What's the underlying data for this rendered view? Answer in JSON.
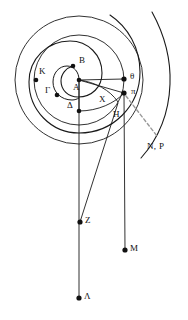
{
  "figure": {
    "background_color": "#ffffff",
    "stroke_color": "#1a1a1a",
    "dash_color": "#9a9a9a",
    "point_color": "#111111"
  },
  "labels": {
    "A": "A",
    "B": "B",
    "K": "K",
    "Gamma": "Γ",
    "Delta": "Δ",
    "theta": "θ",
    "pi": "π",
    "X": "X",
    "H": "H",
    "NP": "N, P",
    "Z": "Z",
    "M": "M",
    "Lambda": "Λ"
  },
  "points": [
    {
      "id": "A",
      "label": "A",
      "x": 79,
      "y": 80,
      "label_x": 73,
      "label_y": 83,
      "dot": true
    },
    {
      "id": "B",
      "label": "B",
      "x": 73,
      "y": 66,
      "label_x": 79,
      "label_y": 58,
      "dot": true
    },
    {
      "id": "K",
      "label": "K",
      "x": 36,
      "y": 80,
      "label_x": 39,
      "label_y": 69,
      "dot": true
    },
    {
      "id": "Gamma",
      "label": "Γ",
      "x": 57,
      "y": 95,
      "label_x": 46,
      "label_y": 88,
      "dot": true
    },
    {
      "id": "Delta",
      "label": "Δ",
      "x": 79,
      "y": 111,
      "label_x": 68,
      "label_y": 103,
      "dot": true
    },
    {
      "id": "theta",
      "label": "θ",
      "x": 124,
      "y": 79,
      "label_x": 130,
      "label_y": 73,
      "dot": true
    },
    {
      "id": "pi",
      "label": "π",
      "x": 124,
      "y": 93,
      "label_x": 131,
      "label_y": 88,
      "dot": true
    },
    {
      "id": "X",
      "label": "X",
      "x": 104,
      "y": 99,
      "label_x": 100,
      "label_y": 97,
      "dot": false
    },
    {
      "id": "H",
      "label": "H",
      "x": 118,
      "y": 114,
      "label_x": 114,
      "label_y": 112,
      "dot": false
    },
    {
      "id": "NP",
      "label": "N, P",
      "x": 152,
      "y": 148,
      "label_x": 148,
      "label_y": 143,
      "dot": false
    },
    {
      "id": "Z",
      "label": "Z",
      "x": 80,
      "y": 222,
      "label_x": 85,
      "label_y": 216,
      "dot": true
    },
    {
      "id": "M",
      "label": "M",
      "x": 125,
      "y": 250,
      "label_x": 130,
      "label_y": 244,
      "dot": true
    },
    {
      "id": "Lambda",
      "label": "Λ",
      "x": 79,
      "y": 298,
      "label_x": 84,
      "label_y": 292,
      "dot": true
    }
  ],
  "geometry": {
    "center": {
      "x": 79,
      "y": 80
    },
    "circles": [
      {
        "name": "outer-circle",
        "cx": 79,
        "cy": 80,
        "r": 64
      },
      {
        "name": "middle-circle",
        "cx": 79,
        "cy": 80,
        "r": 45
      },
      {
        "name": "inner-arc",
        "cx": 79,
        "cy": 80,
        "r": 31
      }
    ],
    "radial_lines": [
      {
        "name": "segment-a-theta",
        "from": "A",
        "to": "theta"
      },
      {
        "name": "segment-a-pi",
        "from": "A",
        "to": "pi"
      },
      {
        "name": "segment-a-delta",
        "from": "A",
        "to": "Delta"
      }
    ],
    "vertical_lines": [
      {
        "name": "line-a-lambda",
        "x1": 79,
        "y1": 80,
        "x2": 79,
        "y2": 298
      },
      {
        "name": "line-pi-m",
        "x1": 124,
        "y1": 93,
        "x2": 125,
        "y2": 250
      }
    ],
    "oblique_lines": [
      {
        "name": "line-h-z",
        "x1": 117,
        "y1": 104,
        "x2": 80,
        "y2": 222
      }
    ],
    "dashed_lines": [
      {
        "name": "dashed-pi-np",
        "x1": 125,
        "y1": 95,
        "x2": 156,
        "y2": 135
      }
    ],
    "spiral": {
      "name": "archimedean-spiral",
      "turns": 2,
      "start_angle_deg": 95,
      "outer_tail_end": {
        "x": 152,
        "y": 12
      }
    }
  }
}
